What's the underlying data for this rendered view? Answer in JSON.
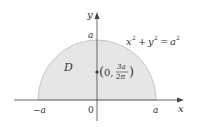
{
  "diagram": {
    "type": "region-plot",
    "equation": {
      "lhs_x": "x",
      "lhs_x_exp": "2",
      "plus": "+",
      "lhs_y": "y",
      "lhs_y_exp": "2",
      "equals": "=",
      "rhs": "a",
      "rhs_exp": "2"
    },
    "region_label": "D",
    "centroid": {
      "open": "(",
      "x": "0,",
      "numerator": "3a",
      "denominator": "2π",
      "close": ")"
    },
    "axes": {
      "x_label": "x",
      "y_label": "y",
      "origin_label": "0",
      "x_neg_tick": "−a",
      "x_pos_tick": "a",
      "y_tick": "a"
    },
    "colors": {
      "region_fill": "#e6e6e6",
      "region_stroke": "#bdbdbd",
      "axis": "#444444",
      "text": "#333333"
    }
  }
}
